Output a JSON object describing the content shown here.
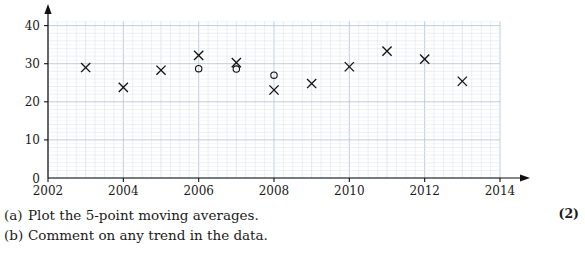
{
  "chart_data": {
    "type": "scatter",
    "title": "",
    "xlabel": "Year",
    "ylabel": "Catch (000s)",
    "xlim": [
      2002,
      2014
    ],
    "ylim": [
      0,
      42
    ],
    "xticks": [
      2002,
      2004,
      2006,
      2008,
      2010,
      2012,
      2014
    ],
    "yticks": [
      0,
      10,
      20,
      30,
      40
    ],
    "grid": true,
    "series": [
      {
        "name": "Catch",
        "marker": "cross",
        "x": [
          2003,
          2004,
          2005,
          2006,
          2007,
          2008,
          2009,
          2010,
          2011,
          2012,
          2013
        ],
        "values": [
          29.0,
          23.8,
          28.3,
          32.2,
          30.3,
          23.1,
          24.8,
          29.2,
          33.3,
          31.2,
          25.4
        ]
      },
      {
        "name": "5-point moving average",
        "marker": "open-circle",
        "x": [
          2006,
          2007,
          2008
        ],
        "values": [
          28.7,
          28.6,
          27.0
        ]
      }
    ]
  },
  "questions": [
    {
      "tag": "(a)",
      "text": "Plot the 5-point moving averages."
    },
    {
      "tag": "(b)",
      "text": "Comment on any trend in the data."
    }
  ],
  "marks": "(2)"
}
